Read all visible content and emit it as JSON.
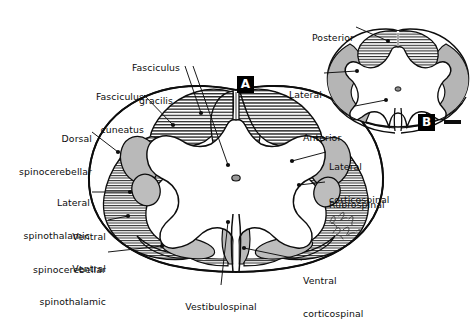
{
  "figure": {
    "panels": [
      {
        "id": "A",
        "marker": "A",
        "caption": "Main cross-section with named tracts"
      },
      {
        "id": "B",
        "marker": "B",
        "caption": "Inset showing the three funiculi"
      }
    ]
  },
  "markers": {
    "a": "A",
    "b": "B"
  },
  "labels_left": [
    {
      "key": "fasciculus_cuneatus",
      "line1": "Fasciculus",
      "line2": "cuneatus"
    },
    {
      "key": "dorsal_spinocerebellar",
      "line1": "Dorsal",
      "line2": "spinocerebellar"
    },
    {
      "key": "lateral_spinothalamic",
      "line1": "Lateral",
      "line2": "spinothalamic"
    },
    {
      "key": "ventral_spinocerebellar",
      "line1": "Ventral",
      "line2": "spinocerebellar"
    },
    {
      "key": "ventral_spinothalamic",
      "line1": "Ventral",
      "line2": "spinothalamic"
    }
  ],
  "labels_top": [
    {
      "key": "fasciculus_gracilis",
      "line1": "Fasciculus",
      "line2": "gracilis"
    }
  ],
  "labels_right": [
    {
      "key": "lateral_corticospinal",
      "line1": "Lateral",
      "line2": "corticospinal"
    },
    {
      "key": "rubrospinal",
      "line1": "Rubrospinal",
      "line2": ""
    },
    {
      "key": "ventral_corticospinal",
      "line1": "Ventral",
      "line2": "corticospinal"
    }
  ],
  "labels_bottom": [
    {
      "key": "vestibulospinal",
      "line1": "Vestibulospinal",
      "line2": ""
    }
  ],
  "labels_inset": [
    {
      "key": "posterior",
      "line1": "Posterior",
      "line2": ""
    },
    {
      "key": "lateral",
      "line1": "Lateral",
      "line2": ""
    },
    {
      "key": "anterior",
      "line1": "Anterior",
      "line2": ""
    }
  ],
  "colors": {
    "background": "#ffffff",
    "ink": "#0d0d0d",
    "gray_tract": "#b4b4b4",
    "gray_tract_light": "#c8c8c8",
    "hatch": "#2a2a2a",
    "marker_bg": "#000000",
    "marker_fg": "#ffffff"
  },
  "signature": {
    "present": true,
    "text": ""
  }
}
